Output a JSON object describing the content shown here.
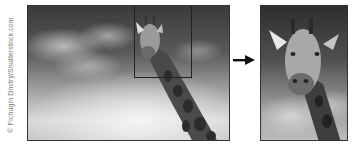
{
  "credit": {
    "text": "© Pichugin Dmitry/Shutterstock.com"
  },
  "figure": {
    "original_photo": {
      "subject": "giraffe-against-cloudy-sky",
      "style": "grayscale"
    },
    "crop_region": {
      "shape": "rectangle",
      "position": "upper-center-right"
    },
    "arrow": {
      "direction": "right",
      "icon": "arrow-right-icon"
    },
    "cropped_photo": {
      "subject": "giraffe-head-closeup",
      "style": "grayscale"
    }
  },
  "colors": {
    "background": "#ffffff",
    "border": "#333333",
    "arrow": "#111111",
    "credit_text": "#7a7a7a"
  }
}
